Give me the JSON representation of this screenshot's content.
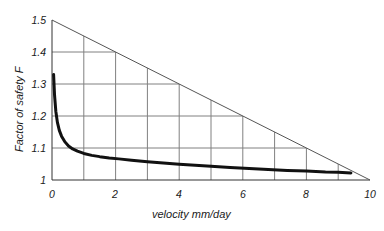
{
  "chart_data": {
    "type": "line",
    "title": "",
    "subtitle": "",
    "xlabel": "velocity mm/day",
    "ylabel": "Factor of safety F",
    "xlim": [
      0,
      10
    ],
    "ylim": [
      1,
      1.5
    ],
    "xticks": [
      "0",
      "2",
      "4",
      "6",
      "8",
      "10"
    ],
    "xtick_values": [
      0,
      2,
      4,
      6,
      8,
      10
    ],
    "yticks": [
      "1",
      "1.1",
      "1.2",
      "1.3",
      "1.4",
      "1.5"
    ],
    "ytick_values": [
      1,
      1.1,
      1.2,
      1.3,
      1.4,
      1.5
    ],
    "grid": true,
    "grid_x_step": 1,
    "grid_y_step": 0.1,
    "legend": null,
    "legend_position": "none",
    "colors": {
      "curve": "#111111",
      "grid": "#808080",
      "axis": "#333333",
      "background": "#ffffff",
      "text": "#1a1a1a"
    },
    "series": [
      {
        "name": "Factor of safety",
        "type": "line",
        "linewidth": 3,
        "color": "#111111",
        "x": [
          0.05,
          0.08,
          0.12,
          0.17,
          0.23,
          0.3,
          0.4,
          0.52,
          0.65,
          0.8,
          1.0,
          1.25,
          1.5,
          1.8,
          2.1,
          2.5,
          3.0,
          3.5,
          4.0,
          4.5,
          5.0,
          5.6,
          6.2,
          6.8,
          7.4,
          8.0,
          8.6,
          9.0,
          9.4
        ],
        "y": [
          1.33,
          1.265,
          1.215,
          1.18,
          1.155,
          1.137,
          1.12,
          1.106,
          1.097,
          1.09,
          1.083,
          1.077,
          1.073,
          1.069,
          1.066,
          1.062,
          1.057,
          1.053,
          1.049,
          1.046,
          1.043,
          1.039,
          1.036,
          1.033,
          1.03,
          1.028,
          1.025,
          1.024,
          1.022
        ]
      },
      {
        "name": "upper boundary",
        "type": "line",
        "linewidth": 1,
        "color": "#555555",
        "x": [
          0,
          10
        ],
        "y": [
          1.5,
          1.0
        ]
      }
    ],
    "annotations": []
  },
  "geometry": {
    "plot_left": 52,
    "plot_right": 370,
    "plot_top": 20,
    "plot_bottom": 180
  }
}
